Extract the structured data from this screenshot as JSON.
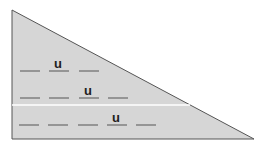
{
  "diagram": {
    "shape": "right-triangle",
    "fill_color": "#d6d6d6",
    "stroke_color": "#555555",
    "divider_color": "#ffffff",
    "rows": [
      {
        "blanks": 3,
        "letter": "u",
        "letter_position": 2
      },
      {
        "blanks": 4,
        "letter": "u",
        "letter_position": 3
      },
      {
        "blanks": 5,
        "letter": "u",
        "letter_position": 4
      }
    ]
  }
}
